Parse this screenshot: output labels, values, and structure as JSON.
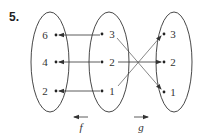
{
  "problem": {
    "number": "5."
  },
  "sets": {
    "left": {
      "elements": [
        "6",
        "4",
        "2"
      ]
    },
    "middle": {
      "elements": [
        "3",
        "2",
        "1"
      ]
    },
    "right": {
      "elements": [
        "3",
        "2",
        "1"
      ]
    }
  },
  "functions": {
    "f": {
      "label": "f",
      "direction": "middle-to-left",
      "mappings": [
        {
          "from": "3",
          "to": "6"
        },
        {
          "from": "2",
          "to": "4"
        },
        {
          "from": "1",
          "to": "2"
        }
      ]
    },
    "g": {
      "label": "g",
      "direction": "middle-to-right",
      "mappings": [
        {
          "from": "3",
          "to": "1"
        },
        {
          "from": "2",
          "to": "2"
        },
        {
          "from": "1",
          "to": "3"
        }
      ]
    }
  },
  "colors": {
    "stroke": "#333333",
    "background": "#ffffff"
  }
}
